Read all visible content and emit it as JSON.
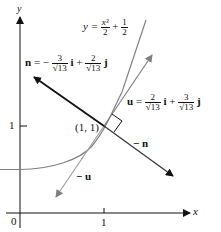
{
  "axes": {
    "x_label": "x",
    "y_label": "y",
    "origin_label": "0",
    "x_tick_label": "1",
    "y_tick_label": "1"
  },
  "curve": {
    "lhs": "y =",
    "num": "x³",
    "den": "2",
    "plus": "+",
    "num2": "1",
    "den2": "2"
  },
  "point_label": "(1, 1)",
  "vector_n": {
    "name": "n",
    "eq": "= −",
    "c1_num": "3",
    "c1_den": "√13",
    "i": "i",
    "plus": "+",
    "c2_num": "2",
    "c2_den": "√13",
    "j": "j"
  },
  "vector_u": {
    "name": "u",
    "eq": "=",
    "c1_num": "2",
    "c1_den": "√13",
    "i": "i",
    "plus": "+",
    "c2_num": "3",
    "c2_den": "√13",
    "j": "j"
  },
  "neg_n_label": "− n",
  "neg_u_label": "− u",
  "colors": {
    "black": "#111111",
    "gray": "#808080"
  }
}
